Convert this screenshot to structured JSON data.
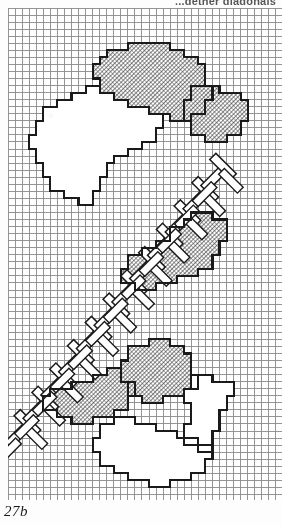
{
  "page": {
    "top_caption": "...gether diagonals",
    "figure_label": "27b",
    "background_color": "#ffffff",
    "ink_color": "#1a1a1a"
  },
  "chart_data": {
    "type": "heatmap",
    "subtitle": "Square grid pattern with hatched fill areas, outlined plain areas and a diagonal herringbone stem",
    "xlabel": "",
    "ylabel": "",
    "grid": true,
    "legend": "none",
    "axis": {
      "x_range": [
        0,
        39
      ],
      "y_range": [
        0,
        70
      ],
      "cell_size_px": 7.05
    },
    "tick_labels": {
      "x": [],
      "y": []
    },
    "colors": {
      "grid_line": "#8a8a8a",
      "grid_line_major": "#6f6f6f",
      "outline": "#1a1a1a",
      "hatch_fill": "#4a4a4a",
      "plain_fill": "#ffffff",
      "paper": "#ffffff"
    },
    "cell_codes": {
      "0": "empty grid square",
      "1": "hatched / shaded stitch block",
      "2": "outlined plain (white) stitch block",
      "3": "herringbone diagonal stroke block"
    },
    "regions": [
      {
        "name": "upper-petal-hatched",
        "code": 1,
        "description": "Large hatched petal across the upper centre of the chart",
        "outline": [
          [
            14,
            6
          ],
          [
            17,
            6
          ],
          [
            17,
            5
          ],
          [
            23,
            5
          ],
          [
            23,
            6
          ],
          [
            25,
            6
          ],
          [
            25,
            7
          ],
          [
            27,
            7
          ],
          [
            27,
            8
          ],
          [
            28,
            8
          ],
          [
            28,
            11
          ],
          [
            29,
            11
          ],
          [
            29,
            13
          ],
          [
            28,
            13
          ],
          [
            28,
            15
          ],
          [
            26,
            15
          ],
          [
            26,
            16
          ],
          [
            23,
            16
          ],
          [
            23,
            15
          ],
          [
            20,
            15
          ],
          [
            20,
            14
          ],
          [
            17,
            14
          ],
          [
            17,
            13
          ],
          [
            15,
            13
          ],
          [
            15,
            12
          ],
          [
            13,
            12
          ],
          [
            13,
            10
          ],
          [
            12,
            10
          ],
          [
            12,
            8
          ],
          [
            13,
            8
          ],
          [
            13,
            7
          ],
          [
            14,
            7
          ]
        ]
      },
      {
        "name": "upper-right-hatched-lobe",
        "code": 1,
        "description": "Hatched lobe at the upper right, reaching the right margin",
        "outline": [
          [
            26,
            11
          ],
          [
            30,
            11
          ],
          [
            30,
            12
          ],
          [
            33,
            12
          ],
          [
            33,
            13
          ],
          [
            34,
            13
          ],
          [
            34,
            16
          ],
          [
            33,
            16
          ],
          [
            33,
            18
          ],
          [
            31,
            18
          ],
          [
            31,
            19
          ],
          [
            28,
            19
          ],
          [
            28,
            18
          ],
          [
            26,
            18
          ],
          [
            26,
            16
          ],
          [
            25,
            16
          ],
          [
            25,
            13
          ],
          [
            26,
            13
          ]
        ]
      },
      {
        "name": "upper-left-petal-outline",
        "code": 2,
        "description": "Large plain outlined petal on the upper left",
        "outline": [
          [
            5,
            14
          ],
          [
            7,
            14
          ],
          [
            7,
            13
          ],
          [
            9,
            13
          ],
          [
            9,
            12
          ],
          [
            11,
            12
          ],
          [
            11,
            11
          ],
          [
            13,
            11
          ],
          [
            13,
            12
          ],
          [
            15,
            12
          ],
          [
            15,
            13
          ],
          [
            17,
            13
          ],
          [
            17,
            14
          ],
          [
            20,
            14
          ],
          [
            20,
            15
          ],
          [
            22,
            15
          ],
          [
            22,
            17
          ],
          [
            21,
            17
          ],
          [
            21,
            19
          ],
          [
            19,
            19
          ],
          [
            19,
            20
          ],
          [
            17,
            20
          ],
          [
            17,
            21
          ],
          [
            15,
            21
          ],
          [
            15,
            22
          ],
          [
            14,
            22
          ],
          [
            14,
            24
          ],
          [
            13,
            24
          ],
          [
            13,
            26
          ],
          [
            12,
            26
          ],
          [
            12,
            28
          ],
          [
            10,
            28
          ],
          [
            10,
            27
          ],
          [
            8,
            27
          ],
          [
            8,
            26
          ],
          [
            6,
            26
          ],
          [
            6,
            24
          ],
          [
            5,
            24
          ],
          [
            5,
            22
          ],
          [
            4,
            22
          ],
          [
            4,
            20
          ],
          [
            3,
            20
          ],
          [
            3,
            18
          ],
          [
            4,
            18
          ],
          [
            4,
            16
          ],
          [
            5,
            16
          ]
        ]
      },
      {
        "name": "herringbone-stem",
        "code": 3,
        "description": "Diagonal herringbone stem running from lower-left to upper-right across the middle of the chart",
        "stroke_count": 24,
        "direction": "45-degree alternating chevrons",
        "bounding_box": [
          1,
          22,
          30,
          60
        ]
      },
      {
        "name": "mid-right-hatched-leaf",
        "code": 1,
        "description": "Hatched leaf cluster on the middle right",
        "outline": [
          [
            26,
            29
          ],
          [
            29,
            29
          ],
          [
            29,
            30
          ],
          [
            31,
            30
          ],
          [
            31,
            33
          ],
          [
            30,
            33
          ],
          [
            30,
            35
          ],
          [
            29,
            35
          ],
          [
            29,
            37
          ],
          [
            27,
            37
          ],
          [
            27,
            38
          ],
          [
            24,
            38
          ],
          [
            24,
            39
          ],
          [
            21,
            39
          ],
          [
            21,
            40
          ],
          [
            18,
            40
          ],
          [
            18,
            39
          ],
          [
            16,
            39
          ],
          [
            16,
            37
          ],
          [
            17,
            37
          ],
          [
            17,
            35
          ],
          [
            19,
            35
          ],
          [
            19,
            34
          ],
          [
            21,
            34
          ],
          [
            21,
            33
          ],
          [
            23,
            33
          ],
          [
            23,
            31
          ],
          [
            25,
            31
          ],
          [
            25,
            30
          ],
          [
            26,
            30
          ]
        ]
      },
      {
        "name": "lower-left-hatched-petal",
        "code": 1,
        "description": "Hatched petal of the lower flower, left lobe",
        "outline": [
          [
            6,
            54
          ],
          [
            9,
            54
          ],
          [
            9,
            53
          ],
          [
            12,
            53
          ],
          [
            12,
            52
          ],
          [
            14,
            52
          ],
          [
            14,
            51
          ],
          [
            16,
            51
          ],
          [
            16,
            53
          ],
          [
            18,
            53
          ],
          [
            18,
            55
          ],
          [
            17,
            55
          ],
          [
            17,
            57
          ],
          [
            15,
            57
          ],
          [
            15,
            58
          ],
          [
            12,
            58
          ],
          [
            12,
            59
          ],
          [
            9,
            59
          ],
          [
            9,
            58
          ],
          [
            7,
            58
          ],
          [
            7,
            57
          ],
          [
            5,
            57
          ],
          [
            5,
            55
          ],
          [
            6,
            55
          ]
        ]
      },
      {
        "name": "lower-centre-hatched-petal",
        "code": 1,
        "description": "Hatched upper petal of the lower flower",
        "outline": [
          [
            17,
            48
          ],
          [
            20,
            48
          ],
          [
            20,
            47
          ],
          [
            23,
            47
          ],
          [
            23,
            48
          ],
          [
            25,
            48
          ],
          [
            25,
            49
          ],
          [
            26,
            49
          ],
          [
            26,
            52
          ],
          [
            27,
            52
          ],
          [
            27,
            54
          ],
          [
            25,
            54
          ],
          [
            25,
            55
          ],
          [
            22,
            55
          ],
          [
            22,
            56
          ],
          [
            19,
            56
          ],
          [
            19,
            55
          ],
          [
            17,
            55
          ],
          [
            17,
            53
          ],
          [
            16,
            53
          ],
          [
            16,
            50
          ],
          [
            17,
            50
          ]
        ]
      },
      {
        "name": "lower-flower-plain-petal",
        "code": 2,
        "description": "Large plain outlined bottom petal of the lower flower",
        "outline": [
          [
            15,
            58
          ],
          [
            18,
            58
          ],
          [
            18,
            59
          ],
          [
            21,
            59
          ],
          [
            21,
            60
          ],
          [
            24,
            60
          ],
          [
            24,
            61
          ],
          [
            27,
            61
          ],
          [
            27,
            62
          ],
          [
            29,
            62
          ],
          [
            29,
            64
          ],
          [
            28,
            64
          ],
          [
            28,
            66
          ],
          [
            26,
            66
          ],
          [
            26,
            67
          ],
          [
            23,
            67
          ],
          [
            23,
            68
          ],
          [
            20,
            68
          ],
          [
            20,
            67
          ],
          [
            17,
            67
          ],
          [
            17,
            66
          ],
          [
            15,
            66
          ],
          [
            15,
            65
          ],
          [
            13,
            65
          ],
          [
            13,
            63
          ],
          [
            12,
            63
          ],
          [
            12,
            61
          ],
          [
            13,
            61
          ],
          [
            13,
            59
          ],
          [
            15,
            59
          ]
        ]
      },
      {
        "name": "lower-right-plain-lobe",
        "code": 2,
        "description": "Plain outlined lobe on the right of the lower flower",
        "outline": [
          [
            26,
            52
          ],
          [
            29,
            52
          ],
          [
            29,
            53
          ],
          [
            32,
            53
          ],
          [
            32,
            55
          ],
          [
            31,
            55
          ],
          [
            31,
            57
          ],
          [
            30,
            57
          ],
          [
            30,
            60
          ],
          [
            29,
            60
          ],
          [
            29,
            63
          ],
          [
            27,
            63
          ],
          [
            27,
            62
          ],
          [
            25,
            62
          ],
          [
            25,
            59
          ],
          [
            26,
            59
          ],
          [
            26,
            56
          ],
          [
            25,
            56
          ],
          [
            25,
            54
          ],
          [
            26,
            54
          ]
        ]
      }
    ],
    "counts": {
      "columns": 39,
      "rows": 70,
      "hatched_regions": 5,
      "outlined_regions": 4,
      "herringbone_regions": 1
    }
  }
}
